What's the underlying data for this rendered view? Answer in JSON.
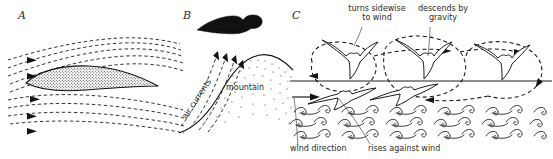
{
  "figure": {
    "background_color": "#ffffff",
    "ink_color": "#141414",
    "panel_count": 3
  },
  "panels": [
    {
      "letter": "A",
      "name": "airfoil-streamlines",
      "description": "Cross-section of an airfoil (wing) with dashed streamlines of airflow passing above and below; arrows indicate flow direction from left to right.",
      "labels": [],
      "elements": {
        "airfoil": "stippled teardrop wing cross-section",
        "streamlines": "dashed curved flow lines",
        "flow_arrows": 5,
        "flow_direction": "left to right"
      }
    },
    {
      "letter": "B",
      "name": "slope-soaring-mountain",
      "description": "A soaring bird above a mountain slope; dashed arrows show air currents deflected upward by the windward face of the mountain.",
      "labels": [
        {
          "text": "air currents",
          "name": "air-currents-label",
          "rotated": true
        },
        {
          "text": "mountain",
          "name": "mountain-label",
          "rotated": false
        }
      ],
      "elements": {
        "bird": "gull gliding above ridge",
        "updraft_arrows": 4,
        "terrain": "stippled mountain profile"
      }
    },
    {
      "letter": "C",
      "name": "dynamic-soaring-waves",
      "description": "Dynamic soaring over ocean waves: a bird repeatedly climbs into the wind, turns sidewise, and descends, tracing looping dashed flight paths across a horizontal reference line above the sea.",
      "labels": [
        {
          "text": "turns sidewise",
          "name": "turns-sidewise-label-line1"
        },
        {
          "text": "to wind",
          "name": "turns-sidewise-label-line2"
        },
        {
          "text": "descends by",
          "name": "descends-by-gravity-label-line1"
        },
        {
          "text": "gravity",
          "name": "descends-by-gravity-label-line2"
        },
        {
          "text": "wind direction",
          "name": "wind-direction-label"
        },
        {
          "text": "rises against wind",
          "name": "rises-against-wind-label"
        }
      ],
      "elements": {
        "birds": 6,
        "flight_loops": 3,
        "reference_line": "horizontal line marking height datum",
        "sea": "rows of wave crests",
        "wind_arrow": "short arrow at lower left pointing right"
      }
    }
  ]
}
